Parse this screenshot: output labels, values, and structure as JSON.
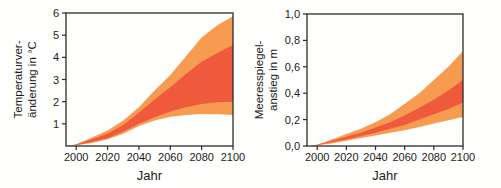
{
  "page": {
    "background": "#fefefd",
    "axis_color": "#2b2b2b",
    "text_color": "#1b1b1b"
  },
  "chart_data": [
    {
      "type": "area",
      "title": "",
      "xlabel": "Jahr",
      "ylabel": "Temperaturveränderung in °C",
      "ylabel_lines": [
        "Temperaturver-",
        "änderung in °C"
      ],
      "x": [
        1995,
        2000,
        2010,
        2020,
        2030,
        2040,
        2050,
        2060,
        2070,
        2080,
        2090,
        2100
      ],
      "xlim": [
        1993.5,
        2100
      ],
      "ylim": [
        0,
        6
      ],
      "xticks": [
        2000,
        2020,
        2040,
        2060,
        2080,
        2100
      ],
      "xtick_labels": [
        "2000",
        "2020",
        "2040",
        "2060",
        "2080",
        "2100"
      ],
      "yticks": [
        1,
        2,
        3,
        4,
        5,
        6
      ],
      "ytick_labels": [
        "1",
        "2",
        "3",
        "4",
        "5",
        "6"
      ],
      "grid": false,
      "legend": "none",
      "bands": [
        {
          "name": "scenario-full-range",
          "color": "#F79B51",
          "upper": [
            0,
            0.08,
            0.38,
            0.7,
            1.15,
            1.75,
            2.5,
            3.2,
            4.05,
            4.9,
            5.45,
            5.85
          ],
          "lower": [
            0,
            0.03,
            0.14,
            0.3,
            0.55,
            0.9,
            1.15,
            1.32,
            1.4,
            1.45,
            1.43,
            1.4
          ]
        },
        {
          "name": "model-average-range",
          "color": "#EE5A3B",
          "upper": [
            0,
            0.07,
            0.3,
            0.55,
            0.95,
            1.5,
            2.1,
            2.65,
            3.25,
            3.8,
            4.2,
            4.55
          ],
          "lower": [
            0,
            0.04,
            0.18,
            0.35,
            0.65,
            1.0,
            1.3,
            1.55,
            1.75,
            1.9,
            1.97,
            2.0
          ]
        }
      ]
    },
    {
      "type": "area",
      "title": "",
      "xlabel": "Jahr",
      "ylabel": "Meeresspiegelanstieg in m",
      "ylabel_lines": [
        "Meeresspiegel-",
        "anstieg in m"
      ],
      "x": [
        1995,
        2000,
        2010,
        2020,
        2030,
        2040,
        2050,
        2060,
        2070,
        2080,
        2090,
        2100
      ],
      "xlim": [
        1993,
        2100
      ],
      "ylim": [
        0,
        1.0
      ],
      "xticks": [
        2000,
        2020,
        2040,
        2060,
        2080,
        2100
      ],
      "xtick_labels": [
        "2000",
        "2020",
        "2040",
        "2060",
        "2080",
        "2100"
      ],
      "yticks": [
        0,
        0.2,
        0.4,
        0.6,
        0.8,
        1.0
      ],
      "ytick_labels": [
        "0,0",
        "0,2",
        "0,4",
        "0,6",
        "0,8",
        "1,0"
      ],
      "grid": false,
      "legend": "none",
      "bands": [
        {
          "name": "scenario-full-range",
          "color": "#F79B51",
          "upper": [
            0,
            0.01,
            0.05,
            0.09,
            0.13,
            0.18,
            0.24,
            0.32,
            0.4,
            0.5,
            0.6,
            0.72
          ],
          "lower": [
            0,
            0.005,
            0.02,
            0.04,
            0.06,
            0.08,
            0.1,
            0.12,
            0.145,
            0.17,
            0.195,
            0.22
          ]
        },
        {
          "name": "model-average-range",
          "color": "#EE5A3B",
          "upper": [
            0,
            0.01,
            0.04,
            0.07,
            0.1,
            0.14,
            0.18,
            0.23,
            0.29,
            0.35,
            0.42,
            0.5
          ],
          "lower": [
            0,
            0.005,
            0.03,
            0.05,
            0.075,
            0.1,
            0.13,
            0.16,
            0.2,
            0.24,
            0.28,
            0.33
          ]
        }
      ]
    }
  ]
}
